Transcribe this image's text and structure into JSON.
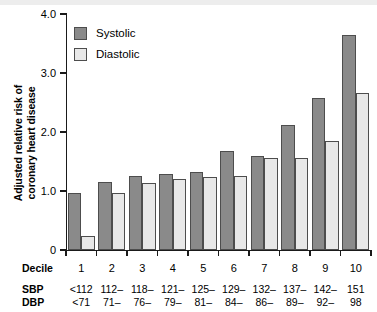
{
  "chart_data": {
    "type": "bar",
    "title": "",
    "subtitle": "",
    "xlabel": "Decile",
    "ylabel": "Adjusted relative risk of coronary heart disease",
    "ylabel_lines": [
      "Adjusted relative risk of",
      "coronary heart disease"
    ],
    "ylim": [
      0,
      4.0
    ],
    "ytick_labels": [
      "0",
      "1.0",
      "2.0",
      "3.0",
      "4.0"
    ],
    "ytick_values": [
      0,
      1.0,
      2.0,
      3.0,
      4.0
    ],
    "grid": false,
    "legend_position": "top-left",
    "categories": [
      "1",
      "2",
      "3",
      "4",
      "5",
      "6",
      "7",
      "8",
      "9",
      "10"
    ],
    "series": [
      {
        "name": "Systolic",
        "color": "#8a8a8a",
        "values": [
          0.97,
          1.15,
          1.25,
          1.28,
          1.33,
          1.68,
          1.6,
          2.12,
          2.57,
          3.65
        ]
      },
      {
        "name": "Diastolic",
        "color": "#e8e8e8",
        "values": [
          0.24,
          0.96,
          1.13,
          1.2,
          1.23,
          1.25,
          1.56,
          1.56,
          1.85,
          2.66
        ]
      }
    ],
    "annotation_rows": [
      {
        "label": "Decile",
        "values": [
          "1",
          "2",
          "3",
          "4",
          "5",
          "6",
          "7",
          "8",
          "9",
          "10"
        ]
      },
      {
        "label": "SBP",
        "values": [
          "<112",
          "112–",
          "118–",
          "121–",
          "125–",
          "129–",
          "132–",
          "137–",
          "142–",
          "151"
        ]
      },
      {
        "label": "DBP",
        "values": [
          "<71",
          "71–",
          "76–",
          "79–",
          "81–",
          "84–",
          "86–",
          "89–",
          "92–",
          "98"
        ]
      }
    ]
  },
  "legend": {
    "items": [
      {
        "label": "Systolic",
        "color": "#8a8a8a"
      },
      {
        "label": "Diastolic",
        "color": "#e8e8e8"
      }
    ]
  },
  "axis": {
    "y_title_line1": "Adjusted relative risk of",
    "y_title_line2": "coronary heart disease",
    "y_ticks": [
      {
        "label": "4.0",
        "value": 4.0
      },
      {
        "label": "3.0",
        "value": 3.0
      },
      {
        "label": "2.0",
        "value": 2.0
      },
      {
        "label": "1.0",
        "value": 1.0
      },
      {
        "label": "0",
        "value": 0
      }
    ]
  },
  "table": {
    "decile_label": "Decile",
    "sbp_label": "SBP",
    "dbp_label": "DBP"
  }
}
